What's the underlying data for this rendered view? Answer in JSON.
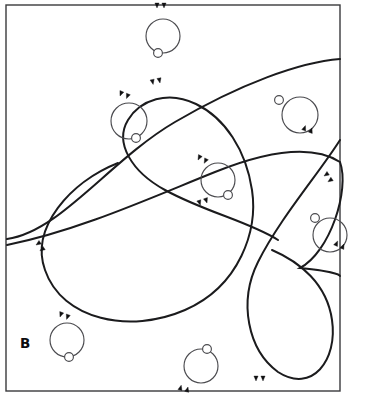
{
  "figure": {
    "panel_letter": "B",
    "kind": "electron-micrograph-tracing",
    "canvas": {
      "width": 365,
      "height": 396,
      "background": "#ffffff"
    },
    "frame": {
      "x": 6,
      "y": 5,
      "width": 334,
      "height": 386,
      "stroke": "#3a3a3c",
      "stroke_width": 1.4
    },
    "colors": {
      "fiber": "#1b1b1d",
      "loop_ring": "#4b4b4f",
      "loop_bead": "#ffffff",
      "arrowhead": "#111113",
      "panel_letter": "#0d0d0f",
      "background": "#ffffff"
    },
    "stroke_widths": {
      "fiber": 2.0,
      "loop": 1.15,
      "frame": 1.4
    },
    "label_position": {
      "x": 20,
      "y": 348
    },
    "counts": {
      "fibers": 4,
      "loops": 7,
      "arrowhead_pairs_on_fibers": 4,
      "arrowhead_pairs_on_loops": 7
    },
    "fibers": [
      {
        "name": "fiber-top-sweep",
        "path": "M 7 239 C 60 232 110 160 175 122 C 240 84 300 62 340 59"
      },
      {
        "name": "fiber-mid-sweep",
        "path": "M 7 245 C 80 230 150 198 215 172 C 275 148 315 146 340 162 C 350 190 330 252 300 268 C 340 272 340 276 340 276"
      },
      {
        "name": "fiber-large-lobe",
        "path": "M 118 163 C 70 182 30 228 45 270 C 62 320 130 334 185 310 C 240 286 258 230 252 190 C 246 150 225 118 196 104 C 168 90 140 100 128 120 C 114 143 132 172 165 190 C 205 212 250 222 278 240"
      },
      {
        "name": "fiber-lower-right-loop",
        "path": "M 340 140 C 320 172 280 218 258 262 C 238 302 248 350 278 372 C 312 394 338 360 332 320 C 327 284 300 262 272 250"
      }
    ],
    "fiber_arrow_pairs": [
      {
        "name": "arrow-pair-fiber-top-left",
        "x": 160,
        "y": 83,
        "rotation": 168,
        "flip": true
      },
      {
        "name": "arrow-pair-fiber-center",
        "x": 207,
        "y": 203,
        "rotation": 162,
        "flip": true
      },
      {
        "name": "arrow-pair-fiber-left-low",
        "x": 36,
        "y": 245,
        "rotation": 56,
        "flip": false
      },
      {
        "name": "arrow-pair-fiber-right-up",
        "x": 324,
        "y": 176,
        "rotation": 56,
        "flip": false
      },
      {
        "name": "arrow-pair-fiber-bottom",
        "x": 256,
        "y": 381,
        "rotation": 0,
        "flip": false
      }
    ],
    "loops": [
      {
        "name": "loop-top-center",
        "cx": 163,
        "cy": 36,
        "r": 17,
        "bead": {
          "cx": 158,
          "cy": 53,
          "r": 4.4
        },
        "arrows": {
          "x": 157,
          "y": 8,
          "rotation": 0,
          "flip": false
        }
      },
      {
        "name": "loop-upper-left",
        "cx": 129,
        "cy": 121,
        "r": 18,
        "bead": {
          "cx": 136,
          "cy": 138,
          "r": 4.4
        },
        "arrows": {
          "x": 120,
          "y": 96,
          "rotation": 22,
          "flip": false
        }
      },
      {
        "name": "loop-upper-right",
        "cx": 300,
        "cy": 115,
        "r": 18,
        "bead": {
          "cx": 279,
          "cy": 100,
          "r": 4.4
        },
        "arrows": {
          "x": 312,
          "y": 128,
          "rotation": 200,
          "flip": false
        }
      },
      {
        "name": "loop-center",
        "cx": 218,
        "cy": 180,
        "r": 17,
        "bead": {
          "cx": 228,
          "cy": 195,
          "r": 4.4
        },
        "arrows": {
          "x": 198,
          "y": 160,
          "rotation": 28,
          "flip": false
        }
      },
      {
        "name": "loop-right-middle",
        "cx": 330,
        "cy": 235,
        "r": 17,
        "bead": {
          "cx": 315,
          "cy": 218,
          "r": 4.4
        },
        "arrows": {
          "x": 344,
          "y": 244,
          "rotation": 205,
          "flip": false
        }
      },
      {
        "name": "loop-bottom-left",
        "cx": 67,
        "cy": 340,
        "r": 17,
        "bead": {
          "cx": 69,
          "cy": 357,
          "r": 4.4
        },
        "arrows": {
          "x": 60,
          "y": 317,
          "rotation": 20,
          "flip": false
        }
      },
      {
        "name": "loop-bottom-center",
        "cx": 201,
        "cy": 366,
        "r": 17,
        "bead": {
          "cx": 207,
          "cy": 349,
          "r": 4.4
        },
        "arrows": {
          "x": 188,
          "y": 387,
          "rotation": 195,
          "flip": false
        }
      }
    ]
  }
}
